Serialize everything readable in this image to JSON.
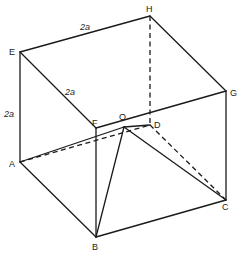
{
  "figure": {
    "vertices": {
      "A": {
        "label": "A",
        "x": 20,
        "y": 162
      },
      "B": {
        "label": "B",
        "x": 96,
        "y": 237
      },
      "C": {
        "label": "C",
        "x": 226,
        "y": 200
      },
      "D": {
        "label": "D",
        "x": 150,
        "y": 125
      },
      "E": {
        "label": "E",
        "x": 20,
        "y": 52
      },
      "F": {
        "label": "F",
        "x": 96,
        "y": 128
      },
      "G": {
        "label": "G",
        "x": 226,
        "y": 91
      },
      "H": {
        "label": "H",
        "x": 150,
        "y": 16
      },
      "O": {
        "label": "O",
        "x": 124,
        "y": 127
      }
    },
    "dimension_labels": {
      "top_edge": "2a",
      "diagonal_edge": "2a",
      "vertical_edge": "2a"
    },
    "solid_edges": [
      [
        "E",
        "H"
      ],
      [
        "H",
        "G"
      ],
      [
        "E",
        "F"
      ],
      [
        "F",
        "G"
      ],
      [
        "E",
        "A"
      ],
      [
        "F",
        "B"
      ],
      [
        "G",
        "C"
      ],
      [
        "A",
        "B"
      ],
      [
        "B",
        "C"
      ],
      [
        "O",
        "B"
      ],
      [
        "O",
        "C"
      ],
      [
        "O",
        "D"
      ]
    ],
    "dashed_edges": [
      [
        "H",
        "D"
      ],
      [
        "A",
        "D"
      ],
      [
        "D",
        "C"
      ],
      [
        "A",
        "O"
      ]
    ]
  }
}
